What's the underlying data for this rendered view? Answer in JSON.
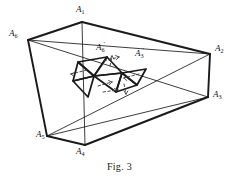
{
  "figure": {
    "caption": "Fig. 3",
    "stroke_color": "#1a1a1a",
    "dashed_color": "#3a3a3a",
    "background_color": "#ffffff",
    "labels": {
      "a1": {
        "base": "A",
        "sub": "1",
        "prime": "",
        "x": 76,
        "y": 6
      },
      "a2": {
        "base": "A",
        "sub": "2",
        "prime": "",
        "x": 214,
        "y": 44
      },
      "a3": {
        "base": "A",
        "sub": "3",
        "prime": "",
        "x": 212,
        "y": 90
      },
      "a4": {
        "base": "A",
        "sub": "4",
        "prime": "",
        "x": 76,
        "y": 147
      },
      "a5": {
        "base": "A",
        "sub": "5",
        "prime": "",
        "x": 37,
        "y": 131
      },
      "a6": {
        "base": "A",
        "sub": "6",
        "prime": "",
        "x": 10,
        "y": 30
      },
      "a6p": {
        "base": "A",
        "sub": "6",
        "prime": "′",
        "x": 97,
        "y": 44
      },
      "a3p": {
        "base": "A",
        "sub": "3",
        "prime": "′",
        "x": 136,
        "y": 50
      }
    },
    "vertices": {
      "A1": [
        82,
        22
      ],
      "A2": [
        210,
        54
      ],
      "A3": [
        208,
        97
      ],
      "A4": [
        85,
        145
      ],
      "A5": [
        47,
        136
      ],
      "A6": [
        28,
        40
      ]
    },
    "outer_edges": [
      [
        "A6",
        "A1"
      ],
      [
        "A1",
        "A2"
      ],
      [
        "A2",
        "A3"
      ],
      [
        "A3",
        "A4"
      ],
      [
        "A4",
        "A5"
      ],
      [
        "A5",
        "A6"
      ]
    ],
    "inner_edges": [
      [
        "A6",
        "A2"
      ],
      [
        "A6",
        "A3"
      ],
      [
        "A5",
        "A2"
      ],
      [
        "A5",
        "A3"
      ],
      [
        "A1",
        "A4"
      ]
    ],
    "inner_triangles": [
      [
        [
          78,
          62
        ],
        [
          107,
          57
        ],
        [
          94,
          76
        ]
      ],
      [
        [
          78,
          62
        ],
        [
          94,
          76
        ],
        [
          73,
          81
        ]
      ],
      [
        [
          73,
          81
        ],
        [
          94,
          76
        ],
        [
          88,
          97
        ]
      ],
      [
        [
          94,
          76
        ],
        [
          107,
          57
        ],
        [
          122,
          73
        ]
      ],
      [
        [
          94,
          76
        ],
        [
          122,
          73
        ],
        [
          116,
          92
        ]
      ],
      [
        [
          122,
          73
        ],
        [
          146,
          69
        ],
        [
          137,
          85
        ]
      ],
      [
        [
          122,
          73
        ],
        [
          137,
          85
        ],
        [
          116,
          92
        ]
      ]
    ],
    "dashed_arrows": [
      {
        "from": [
          104,
          61
        ],
        "to": [
          119,
          57
        ],
        "head": "up-right"
      },
      {
        "from": [
          72,
          74
        ],
        "to": [
          87,
          70
        ],
        "head": "left"
      },
      {
        "from": [
          98,
          85
        ],
        "to": [
          113,
          81
        ],
        "head": "up"
      },
      {
        "from": [
          124,
          78
        ],
        "to": [
          139,
          74
        ],
        "head": "left"
      },
      {
        "from": [
          103,
          92
        ],
        "to": [
          118,
          89
        ],
        "head": "down-right"
      }
    ]
  }
}
